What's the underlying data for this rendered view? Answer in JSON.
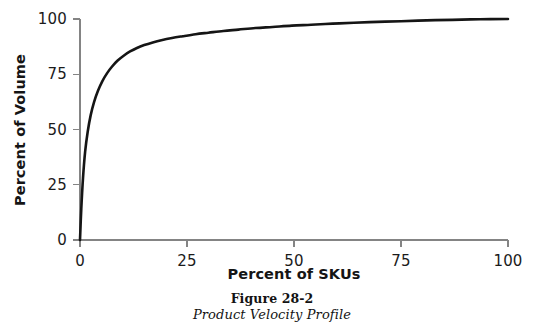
{
  "caption": {
    "figure_number": "Figure 28-2",
    "figure_title": "Product Velocity Profile"
  },
  "chart_data": {
    "type": "line",
    "title": "",
    "subtitle": "",
    "xlabel": "Percent of SKUs",
    "ylabel": "Percent of Volume",
    "xlim": [
      0,
      100
    ],
    "ylim": [
      0,
      100
    ],
    "xticks": [
      0,
      25,
      50,
      75,
      100
    ],
    "yticks": [
      0,
      25,
      50,
      75,
      100
    ],
    "xtick_labels": [
      "0",
      "25",
      "50",
      "75",
      "100"
    ],
    "ytick_labels": [
      "0",
      "25",
      "50",
      "75",
      "100"
    ],
    "grid": false,
    "legend": null,
    "annotations": [],
    "series": [
      {
        "name": "Product Velocity Profile",
        "color": "#151515",
        "x": [
          0.0,
          0.3,
          0.7,
          1.2,
          1.8,
          2.5,
          3.3,
          4.2,
          5.2,
          6.3,
          7.5,
          8.8,
          10.2,
          11.7,
          13.3,
          15.0,
          17.0,
          19.0,
          21.5,
          24.0,
          27.0,
          30.0,
          33.5,
          37.0,
          41.0,
          45.0,
          49.5,
          54.0,
          59.0,
          64.0,
          69.5,
          75.0,
          81.0,
          87.0,
          93.5,
          100.0
        ],
        "y": [
          0.0,
          14.0,
          28.0,
          40.0,
          49.0,
          56.5,
          62.5,
          67.5,
          71.8,
          75.4,
          78.5,
          81.2,
          83.4,
          85.3,
          86.9,
          88.2,
          89.4,
          90.4,
          91.4,
          92.2,
          93.1,
          93.8,
          94.6,
          95.2,
          95.9,
          96.4,
          97.0,
          97.4,
          97.9,
          98.3,
          98.7,
          99.0,
          99.4,
          99.6,
          99.9,
          100.0
        ]
      }
    ]
  },
  "axis_geometry": {
    "plot_left_px": 80,
    "plot_right_px": 508,
    "plot_bottom_px": 240,
    "plot_top_px": 19,
    "axis_color": "#848484",
    "curve_color": "#151515"
  }
}
